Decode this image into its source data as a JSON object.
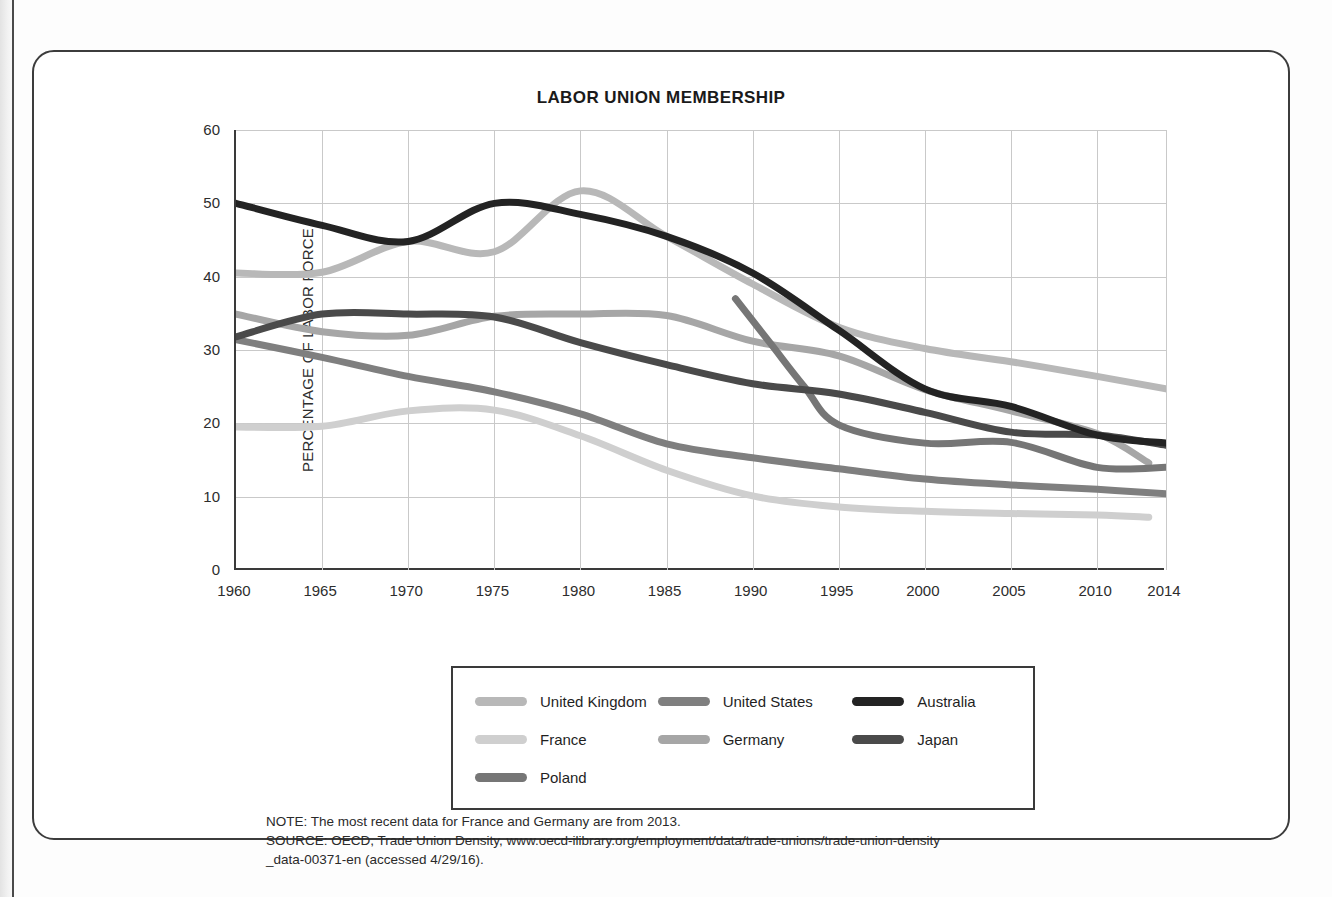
{
  "chart_data": {
    "type": "line",
    "title": "LABOR UNION MEMBERSHIP",
    "xlabel": "",
    "ylabel": "PERCENTAGE OF LABOR FORCE",
    "xlim": [
      1960,
      2014
    ],
    "ylim": [
      0,
      60
    ],
    "yticks": [
      0,
      10,
      20,
      30,
      40,
      50,
      60
    ],
    "xticks": [
      1960,
      1965,
      1970,
      1975,
      1980,
      1985,
      1990,
      1995,
      2000,
      2005,
      2010,
      2014
    ],
    "grid": true,
    "legend_position": "bottom",
    "series": [
      {
        "name": "United Kingdom",
        "color": "#b8b8b8",
        "x": [
          1960,
          1965,
          1970,
          1975,
          1980,
          1985,
          1990,
          1995,
          2000,
          2005,
          2010,
          2014
        ],
        "values": [
          40.5,
          40.6,
          44.8,
          43.4,
          51.7,
          45.5,
          39.0,
          33.1,
          30.2,
          28.4,
          26.4,
          24.7
        ]
      },
      {
        "name": "United States",
        "color": "#7f7f7f",
        "x": [
          1960,
          1965,
          1970,
          1975,
          1980,
          1985,
          1990,
          1995,
          2000,
          2005,
          2010,
          2014
        ],
        "values": [
          31.4,
          29.0,
          26.4,
          24.3,
          21.3,
          17.2,
          15.3,
          13.8,
          12.4,
          11.6,
          11.0,
          10.4
        ]
      },
      {
        "name": "Australia",
        "color": "#232323",
        "x": [
          1960,
          1965,
          1970,
          1975,
          1980,
          1985,
          1990,
          1995,
          2000,
          2005,
          2010,
          2014
        ],
        "values": [
          50.0,
          47.0,
          44.8,
          50.0,
          48.5,
          45.5,
          40.5,
          32.7,
          24.7,
          22.3,
          18.4,
          17.3
        ]
      },
      {
        "name": "France",
        "color": "#cfcfcf",
        "x": [
          1960,
          1965,
          1970,
          1975,
          1980,
          1985,
          1990,
          1995,
          2000,
          2005,
          2010,
          2013
        ],
        "values": [
          19.5,
          19.6,
          21.7,
          21.8,
          18.3,
          13.6,
          10.1,
          8.6,
          8.0,
          7.7,
          7.5,
          7.2
        ]
      },
      {
        "name": "Germany",
        "color": "#a6a6a6",
        "x": [
          1960,
          1965,
          1970,
          1975,
          1980,
          1985,
          1990,
          1995,
          2000,
          2005,
          2010,
          2013
        ],
        "values": [
          34.9,
          32.5,
          32.0,
          34.6,
          34.9,
          34.7,
          31.2,
          29.2,
          24.6,
          21.7,
          18.6,
          14.6
        ]
      },
      {
        "name": "Japan",
        "color": "#4a4a4a",
        "x": [
          1960,
          1965,
          1970,
          1975,
          1980,
          1985,
          1990,
          1995,
          2000,
          2005,
          2010,
          2014
        ],
        "values": [
          31.8,
          34.9,
          34.9,
          34.5,
          31.0,
          28.0,
          25.4,
          24.0,
          21.5,
          18.8,
          18.4,
          17.0
        ]
      },
      {
        "name": "Poland",
        "color": "#767676",
        "x": [
          1989,
          1991,
          1993,
          1995,
          2000,
          2005,
          2010,
          2014
        ],
        "values": [
          37.0,
          31.0,
          25.0,
          19.8,
          17.3,
          17.4,
          14.0,
          14.0
        ]
      }
    ],
    "notes": [
      "NOTE: The most recent data for France and Germany are from 2013.",
      "SOURCE: OECD, Trade Union Density, www.oecd-ilibrary.org/employment/data/trade-unions/trade-union-density",
      "_data-00371-en (accessed 4/29/16)."
    ]
  },
  "legend": {
    "rows": [
      [
        "United Kingdom",
        "United States",
        "Australia"
      ],
      [
        "France",
        "Germany",
        "Japan"
      ],
      [
        "Poland"
      ]
    ]
  }
}
